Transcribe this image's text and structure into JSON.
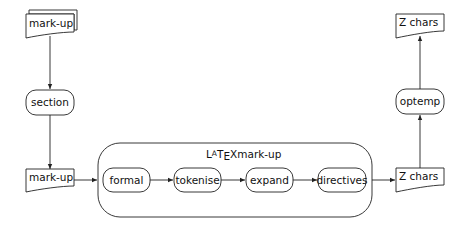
{
  "diagram": {
    "type": "flowchart",
    "nodes": {
      "markup_top": {
        "label": "mark-up",
        "shape": "multi-document"
      },
      "section": {
        "label": "section",
        "shape": "rounded-process"
      },
      "markup_bottom": {
        "label": "mark-up",
        "shape": "document"
      },
      "latex_group": {
        "label_prefix": "LaTeX",
        "label_suffix": "mark-up",
        "shape": "rounded-container"
      },
      "formal": {
        "label": "formal",
        "shape": "rounded-process"
      },
      "tokenise": {
        "label": "tokenise",
        "shape": "rounded-process"
      },
      "expand": {
        "label": "expand",
        "shape": "rounded-process"
      },
      "directives": {
        "label": "directives",
        "shape": "rounded-process"
      },
      "zchars_bottom": {
        "label": "Z chars",
        "shape": "document"
      },
      "optemp": {
        "label": "optemp",
        "shape": "rounded-process"
      },
      "zchars_top": {
        "label": "Z chars",
        "shape": "document"
      }
    },
    "edges": [
      {
        "from": "markup_top",
        "to": "section"
      },
      {
        "from": "section",
        "to": "markup_bottom"
      },
      {
        "from": "markup_bottom",
        "to": "latex_group"
      },
      {
        "from": "formal",
        "to": "tokenise"
      },
      {
        "from": "tokenise",
        "to": "expand"
      },
      {
        "from": "expand",
        "to": "directives"
      },
      {
        "from": "latex_group",
        "to": "zchars_bottom"
      },
      {
        "from": "zchars_bottom",
        "to": "optemp"
      },
      {
        "from": "optemp",
        "to": "zchars_top"
      }
    ]
  }
}
